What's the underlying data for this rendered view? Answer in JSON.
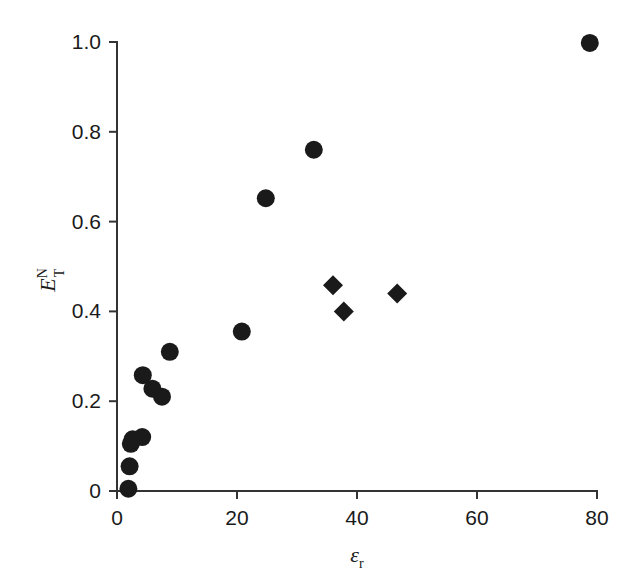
{
  "chart_data": {
    "type": "scatter",
    "title": "",
    "subtitle": "",
    "xlabel": "εr",
    "xlabel_base": "ε",
    "xlabel_sub": "r",
    "ylabel": "ETN",
    "ylabel_base": "E",
    "ylabel_sub": "T",
    "ylabel_sup": "N",
    "xlim": [
      0,
      80
    ],
    "ylim": [
      0,
      1.0
    ],
    "xticks": [
      0,
      20,
      40,
      60,
      80
    ],
    "xtick_labels": [
      "0",
      "20",
      "40",
      "60",
      "80"
    ],
    "yticks": [
      0,
      0.2,
      0.4,
      0.6,
      0.8,
      1.0
    ],
    "ytick_labels": [
      "0",
      "0.2",
      "0.4",
      "0.6",
      "0.8",
      "1.0"
    ],
    "grid": false,
    "legend": null,
    "marker_color": "#1a1a1a",
    "axis_color": "#333333",
    "background": "#ffffff",
    "series": [
      {
        "name": "circles",
        "marker": "circle",
        "points": [
          {
            "x": 1.9,
            "y": 0.005
          },
          {
            "x": 2.1,
            "y": 0.055
          },
          {
            "x": 2.3,
            "y": 0.105
          },
          {
            "x": 2.6,
            "y": 0.115
          },
          {
            "x": 4.2,
            "y": 0.12
          },
          {
            "x": 4.3,
            "y": 0.258
          },
          {
            "x": 5.9,
            "y": 0.228
          },
          {
            "x": 7.5,
            "y": 0.21
          },
          {
            "x": 8.8,
            "y": 0.31
          },
          {
            "x": 20.8,
            "y": 0.355
          },
          {
            "x": 24.8,
            "y": 0.652
          },
          {
            "x": 32.8,
            "y": 0.76
          },
          {
            "x": 78.8,
            "y": 0.998
          }
        ]
      },
      {
        "name": "diamonds",
        "marker": "diamond",
        "points": [
          {
            "x": 36.0,
            "y": 0.458
          },
          {
            "x": 37.8,
            "y": 0.4
          },
          {
            "x": 46.7,
            "y": 0.44
          }
        ]
      }
    ]
  }
}
